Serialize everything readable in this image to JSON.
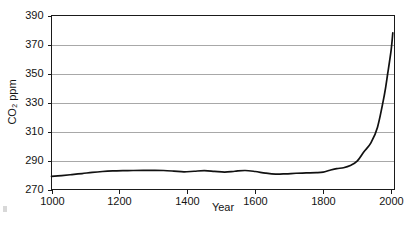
{
  "chart_data": {
    "type": "line",
    "title": "",
    "xlabel": "Year",
    "ylabel": "CO2 ppm",
    "ylabel_display": "CO₂ ppm",
    "xlim": [
      1000,
      2010
    ],
    "ylim": [
      270,
      390
    ],
    "xticks": [
      1000,
      1200,
      1400,
      1600,
      1800,
      2000
    ],
    "xtick_labels": [
      "1000",
      "1200",
      "1400",
      "1600",
      "1800",
      "2000"
    ],
    "yticks": [
      270,
      290,
      310,
      330,
      350,
      370,
      390
    ],
    "ytick_labels": [
      "270",
      "290",
      "310",
      "330",
      "350",
      "370",
      "390"
    ],
    "grid": "horizontal",
    "legend": "none",
    "line_color": "#111111",
    "grid_color": "#a8a8a8",
    "frame_color": "#1a1a1a",
    "series": [
      {
        "name": "Atmospheric CO2",
        "x": [
          1000,
          1030,
          1060,
          1090,
          1120,
          1150,
          1180,
          1210,
          1240,
          1270,
          1300,
          1330,
          1360,
          1390,
          1420,
          1450,
          1480,
          1510,
          1540,
          1570,
          1600,
          1630,
          1660,
          1690,
          1720,
          1750,
          1780,
          1800,
          1820,
          1840,
          1860,
          1880,
          1900,
          1920,
          1940,
          1960,
          1980,
          1990,
          2000,
          2005
        ],
        "y": [
          279.0,
          279.6,
          280.3,
          281.0,
          281.8,
          282.4,
          282.8,
          283.0,
          283.1,
          283.2,
          283.2,
          283.1,
          282.7,
          282.2,
          282.6,
          283.0,
          282.5,
          282.0,
          282.6,
          283.1,
          282.4,
          281.3,
          280.6,
          280.8,
          281.2,
          281.4,
          281.6,
          282.0,
          283.3,
          284.4,
          285.0,
          286.5,
          289.5,
          296.0,
          302.0,
          313.0,
          335.0,
          350.0,
          366.0,
          378.0
        ]
      }
    ],
    "annotations": []
  },
  "axes": {
    "y_axis_title": "CO₂ ppm",
    "x_axis_title": "Year"
  }
}
